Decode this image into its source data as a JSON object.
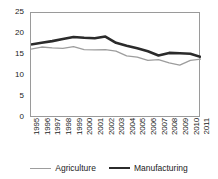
{
  "chart_data": {
    "type": "line",
    "title": "",
    "xlabel": "",
    "ylabel": "",
    "ylim": [
      0,
      25
    ],
    "yticks": [
      0,
      5,
      10,
      15,
      20,
      25
    ],
    "ytick_labels": [
      "0",
      "5",
      "10",
      "15",
      "20",
      "25"
    ],
    "grid": false,
    "legend_position": "bottom",
    "categories": [
      "1995",
      "1996",
      "1997",
      "1998",
      "1999",
      "2000",
      "2001",
      "2002",
      "2003",
      "2004",
      "2005",
      "2006",
      "2007",
      "2008",
      "2009",
      "2010",
      "2011"
    ],
    "series": [
      {
        "name": "Agriculture",
        "color": "#9d9d9d",
        "width": 1.3,
        "values": [
          16.4,
          16.9,
          16.7,
          16.6,
          17.0,
          16.3,
          16.2,
          16.3,
          15.9,
          14.8,
          14.5,
          13.7,
          13.9,
          13.1,
          12.6,
          13.7,
          14.0
        ]
      },
      {
        "name": "Manufacturing",
        "color": "#2b2b2b",
        "width": 2.6,
        "values": [
          17.5,
          17.9,
          18.3,
          18.8,
          19.3,
          19.1,
          19.0,
          19.4,
          17.9,
          17.2,
          16.6,
          15.9,
          14.9,
          15.5,
          15.4,
          15.3,
          14.5
        ]
      }
    ]
  },
  "legend": {
    "items": [
      {
        "label": "Agriculture"
      },
      {
        "label": "Manufacturing"
      }
    ]
  }
}
